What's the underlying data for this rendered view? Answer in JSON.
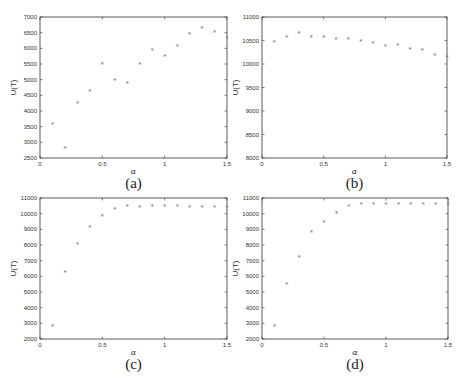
{
  "chart_data": [
    {
      "type": "scatter",
      "panel_label": "(a)",
      "xlabel": "α",
      "ylabel": "U(T)",
      "xlim": [
        0,
        1.5
      ],
      "ylim": [
        2500,
        7000
      ],
      "xticks": [
        0,
        0.5,
        1,
        1.5
      ],
      "xtick_labels": [
        "0",
        "0.5",
        "1",
        "1.5"
      ],
      "yticks": [
        2500,
        3000,
        3500,
        4000,
        4500,
        5000,
        5500,
        6000,
        6500,
        7000
      ],
      "marker": "*",
      "x": [
        0.1,
        0.2,
        0.3,
        0.4,
        0.5,
        0.6,
        0.7,
        0.8,
        0.9,
        1.0,
        1.1,
        1.2,
        1.3,
        1.4,
        1.5
      ],
      "y": [
        3610,
        2830,
        4280,
        4650,
        5510,
        5010,
        4920,
        5530,
        5960,
        5760,
        6100,
        6470,
        6670,
        6530,
        6340
      ]
    },
    {
      "type": "scatter",
      "panel_label": "(b)",
      "xlabel": "α",
      "ylabel": "U(T)",
      "xlim": [
        0,
        1.5
      ],
      "ylim": [
        8000,
        11000
      ],
      "xticks": [
        0,
        0.5,
        1,
        1.5
      ],
      "xtick_labels": [
        "0",
        "0.5",
        "1",
        "1.5"
      ],
      "yticks": [
        8000,
        8500,
        9000,
        9500,
        10000,
        10500,
        11000
      ],
      "marker": "*",
      "x": [
        0.1,
        0.2,
        0.3,
        0.4,
        0.5,
        0.6,
        0.7,
        0.8,
        0.9,
        1.0,
        1.1,
        1.2,
        1.3,
        1.4,
        1.5
      ],
      "y": [
        10480,
        10590,
        10670,
        10590,
        10580,
        10540,
        10540,
        10490,
        10450,
        10390,
        10410,
        10330,
        10300,
        10200,
        10160
      ]
    },
    {
      "type": "scatter",
      "panel_label": "(c)",
      "xlabel": "α",
      "ylabel": "U(T)",
      "xlim": [
        0,
        1.5
      ],
      "ylim": [
        2000,
        11000
      ],
      "xticks": [
        0,
        0.5,
        1,
        1.5
      ],
      "xtick_labels": [
        "0",
        "0.5",
        "1",
        "1.5"
      ],
      "yticks": [
        2000,
        3000,
        4000,
        5000,
        6000,
        7000,
        8000,
        9000,
        10000,
        11000
      ],
      "marker": "*",
      "x": [
        0.1,
        0.2,
        0.3,
        0.4,
        0.5,
        0.6,
        0.7,
        0.8,
        0.9,
        1.0,
        1.1,
        1.2,
        1.3,
        1.4,
        1.5
      ],
      "y": [
        2830,
        6320,
        8090,
        9150,
        9870,
        10300,
        10490,
        10450,
        10510,
        10510,
        10510,
        10470,
        10470,
        10470,
        10430
      ]
    },
    {
      "type": "scatter",
      "panel_label": "(d)",
      "xlabel": "α",
      "ylabel": "U(T)",
      "xlim": [
        0,
        1.5
      ],
      "ylim": [
        2000,
        11000
      ],
      "xticks": [
        0,
        0.5,
        1,
        1.5
      ],
      "xtick_labels": [
        "0",
        "0.5",
        "1",
        "1.5"
      ],
      "yticks": [
        2000,
        3000,
        4000,
        5000,
        6000,
        7000,
        8000,
        9000,
        10000,
        11000
      ],
      "marker": "*",
      "x": [
        0.1,
        0.2,
        0.3,
        0.4,
        0.5,
        0.6,
        0.7,
        0.8,
        0.9,
        1.0,
        1.1,
        1.2,
        1.3,
        1.4,
        1.5
      ],
      "y": [
        2850,
        5570,
        7260,
        8860,
        9520,
        10050,
        10550,
        10640,
        10660,
        10640,
        10640,
        10640,
        10640,
        10640,
        10640
      ]
    }
  ],
  "colors": {
    "marker": "#777777",
    "axis": "#333333",
    "background": "#ffffff"
  }
}
